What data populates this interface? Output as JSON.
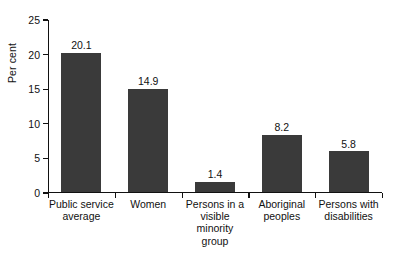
{
  "chart_data": {
    "type": "bar",
    "title": "",
    "xlabel": "",
    "ylabel": "Per cent",
    "ylim": [
      0,
      25
    ],
    "yticks": [
      0,
      5,
      10,
      15,
      20,
      25
    ],
    "grid": false,
    "legend": null,
    "categories": [
      "Public service average",
      "Women",
      "Persons in a visible minority group",
      "Aboriginal peoples",
      "Persons with disabilities"
    ],
    "category_lines": [
      [
        "Public service",
        "average"
      ],
      [
        "Women"
      ],
      [
        "Persons in a",
        "visible minority",
        "group"
      ],
      [
        "Aboriginal",
        "peoples"
      ],
      [
        "Persons with",
        "disabilities"
      ]
    ],
    "values": [
      20.1,
      14.9,
      1.4,
      8.2,
      5.8
    ],
    "value_labels": [
      "20.1",
      "14.9",
      "1.4",
      "8.2",
      "5.8"
    ],
    "bar_color": "#3a3a3a",
    "axis_color": "#111111",
    "background": "#ffffff"
  }
}
